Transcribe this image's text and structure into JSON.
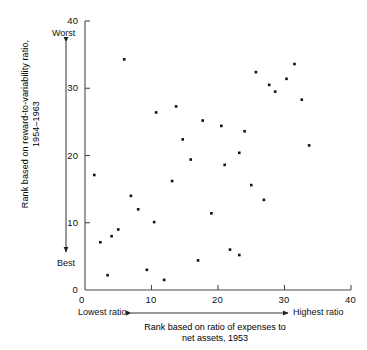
{
  "chart_data": {
    "type": "scatter",
    "title": "",
    "xlabel": "Rank based on ratio of expenses to net assets, 1953",
    "ylabel": "Rank based on reward-to-variability ratio, 1954–1963",
    "xlim": [
      0,
      40
    ],
    "ylim": [
      0,
      40
    ],
    "xticks": [
      0,
      10,
      20,
      30,
      40
    ],
    "yticks": [
      0,
      10,
      20,
      30,
      40
    ],
    "grid": false,
    "legend": null,
    "x_axis_low_anchor": "Lowest ratio",
    "x_axis_high_anchor": "Highest ratio",
    "y_axis_low_anchor": "Best",
    "y_axis_high_anchor": "Worst",
    "marker": "square",
    "marker_color": "#111111",
    "points": [
      {
        "x": 1.4,
        "y": 17.1
      },
      {
        "x": 2.3,
        "y": 7.1
      },
      {
        "x": 3.4,
        "y": 2.2
      },
      {
        "x": 4.0,
        "y": 8.0
      },
      {
        "x": 5.0,
        "y": 9.0
      },
      {
        "x": 5.9,
        "y": 34.3
      },
      {
        "x": 6.9,
        "y": 14.0
      },
      {
        "x": 8.0,
        "y": 12.0
      },
      {
        "x": 9.3,
        "y": 3.0
      },
      {
        "x": 10.4,
        "y": 10.1
      },
      {
        "x": 10.7,
        "y": 26.4
      },
      {
        "x": 11.9,
        "y": 1.5
      },
      {
        "x": 13.1,
        "y": 16.2
      },
      {
        "x": 13.7,
        "y": 27.3
      },
      {
        "x": 14.7,
        "y": 22.4
      },
      {
        "x": 15.9,
        "y": 19.4
      },
      {
        "x": 17.0,
        "y": 4.4
      },
      {
        "x": 17.7,
        "y": 25.2
      },
      {
        "x": 19.0,
        "y": 11.4
      },
      {
        "x": 20.5,
        "y": 24.4
      },
      {
        "x": 21.0,
        "y": 18.6
      },
      {
        "x": 21.8,
        "y": 6.0
      },
      {
        "x": 23.2,
        "y": 5.2
      },
      {
        "x": 23.2,
        "y": 20.4
      },
      {
        "x": 24.0,
        "y": 23.6
      },
      {
        "x": 25.0,
        "y": 15.6
      },
      {
        "x": 25.7,
        "y": 32.4
      },
      {
        "x": 26.9,
        "y": 13.4
      },
      {
        "x": 27.7,
        "y": 30.5
      },
      {
        "x": 28.6,
        "y": 29.5
      },
      {
        "x": 30.3,
        "y": 31.4
      },
      {
        "x": 31.5,
        "y": 33.6
      },
      {
        "x": 32.6,
        "y": 28.3
      },
      {
        "x": 33.7,
        "y": 21.5
      }
    ]
  },
  "axes": {
    "x_tick_labels": [
      "0",
      "10",
      "20",
      "30",
      "40"
    ],
    "y_tick_labels": [
      "0",
      "10",
      "20",
      "30",
      "40"
    ]
  },
  "captions": {
    "y_line1": "Rank based on reward-to-variability ratio,",
    "y_line2": "1954–1963",
    "x_line1": "Rank based on ratio of expenses to",
    "x_line2": "net assets, 1953"
  }
}
